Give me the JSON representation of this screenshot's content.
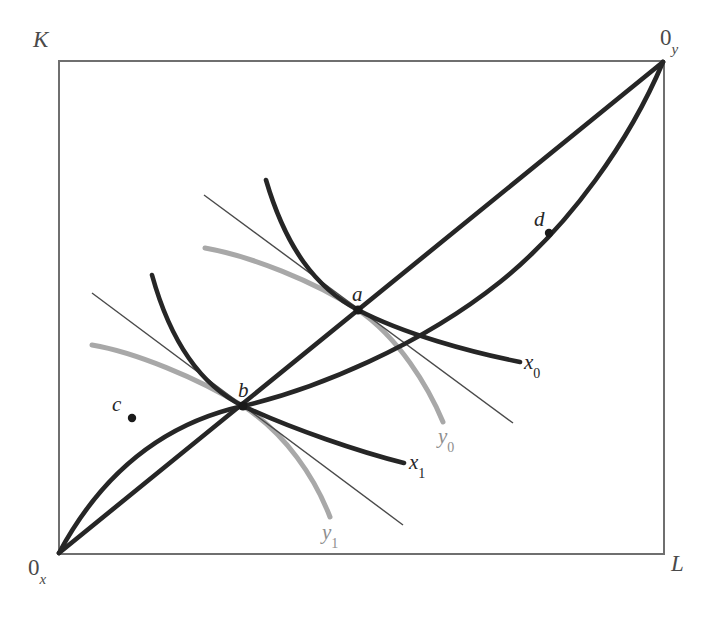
{
  "figure": {
    "width": 723,
    "height": 619,
    "background": "#ffffff"
  },
  "colors": {
    "box_border": "#6f6f6f",
    "dark_curve": "#262626",
    "gray_curve": "#a8a8a8",
    "thin_line": "#4a4a4a",
    "label_text": "#3a3a3a"
  },
  "axes": {
    "vertical_label": "K",
    "horizontal_label": "L",
    "origin_x": {
      "base": "0",
      "sub": "x"
    },
    "origin_y": {
      "base": "0",
      "sub": "y"
    }
  },
  "box": {
    "left": 59,
    "top": 61,
    "right": 664,
    "bottom": 554
  },
  "points": [
    {
      "id": "a",
      "label": "a",
      "x": 358,
      "y": 310,
      "label_x": 352,
      "label_y": 282,
      "on": "contract-curve"
    },
    {
      "id": "b",
      "label": "b",
      "x": 243,
      "y": 406,
      "label_x": 238,
      "label_y": 378,
      "on": "contract-curve"
    },
    {
      "id": "c",
      "label": "c",
      "x": 132,
      "y": 418,
      "label_x": 112,
      "label_y": 392,
      "on": "contract-curve"
    },
    {
      "id": "d",
      "label": "d",
      "x": 549,
      "y": 233,
      "label_x": 534,
      "label_y": 207,
      "on": "contract-curve"
    }
  ],
  "curves": [
    {
      "id": "x0",
      "label": "x",
      "sub": "0",
      "kind": "isoquant-firm-x",
      "color": "dark",
      "label_x": 524,
      "label_y": 350,
      "path": "M 266,180 C 286,248 316,288 358,310 C 404,334 470,352 520,362"
    },
    {
      "id": "x1",
      "label": "x",
      "sub": "1",
      "kind": "isoquant-firm-x",
      "color": "dark",
      "label_x": 409,
      "label_y": 450,
      "path": "M 152,275 C 170,340 200,385 243,406 C 292,429 360,452 404,463"
    },
    {
      "id": "y0",
      "label": "y",
      "sub": "0",
      "kind": "isoquant-firm-y",
      "color": "gray",
      "label_x": 438,
      "label_y": 424,
      "path": "M 205,248 C 250,256 314,281 358,310 C 398,337 428,386 443,422"
    },
    {
      "id": "y1",
      "label": "y",
      "sub": "1",
      "kind": "isoquant-firm-y",
      "color": "gray",
      "label_x": 322,
      "label_y": 520,
      "path": "M 92,345 C 134,352 198,378 243,406 C 286,434 315,478 330,517"
    },
    {
      "id": "contract-curve",
      "label": "",
      "sub": "",
      "kind": "contract-curve",
      "color": "dark",
      "label_x": 0,
      "label_y": 0,
      "path": "M 59,553 C 110,458 180,420 243,406 C 316,389 420,346 500,282 C 570,226 630,140 663,62"
    },
    {
      "id": "diagonal",
      "label": "",
      "sub": "",
      "kind": "diagonal-ray",
      "color": "dark",
      "label_x": 0,
      "label_y": 0,
      "path": "M 59,553 L 663,62"
    }
  ],
  "tangent_lines": [
    {
      "id": "tangent-a",
      "at_point": "a",
      "path": "M 204,195 L 513,423"
    },
    {
      "id": "tangent-b",
      "at_point": "b",
      "path": "M 92,293 L 403,525"
    }
  ]
}
